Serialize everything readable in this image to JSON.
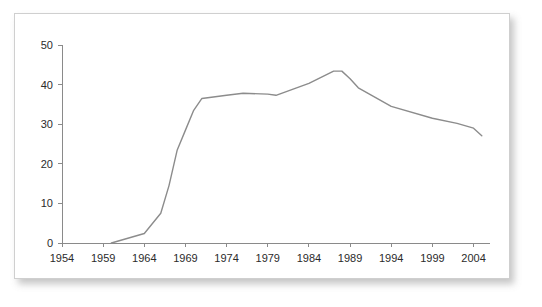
{
  "figure": {
    "background_color": "#ffffff",
    "card_background_color": "#ffffff",
    "card_border_color": "#cfcfcf",
    "line_color": "#8c8c8c",
    "axis_color": "#8a8a8a",
    "text_color": "#2b2b2b"
  },
  "chart_data": {
    "type": "line",
    "title": "",
    "subtitle": "",
    "xlabel": "",
    "ylabel": "",
    "xlim": [
      1954,
      2006
    ],
    "ylim": [
      0,
      50
    ],
    "grid": false,
    "legend": null,
    "legend_position": "none",
    "x_ticks": [
      1954,
      1959,
      1964,
      1969,
      1974,
      1979,
      1984,
      1989,
      1994,
      1999,
      2004
    ],
    "x_tick_labels": [
      "1954",
      "1959",
      "1964",
      "1969",
      "1974",
      "1979",
      "1984",
      "1989",
      "1994",
      "1999",
      "2004"
    ],
    "y_ticks": [
      0,
      10,
      20,
      30,
      40,
      50
    ],
    "y_tick_labels": [
      "0",
      "10",
      "20",
      "30",
      "40",
      "50"
    ],
    "series": [
      {
        "name": "series-1",
        "color": "#8c8c8c",
        "x": [
          1960,
          1964,
          1966,
          1967,
          1968,
          1969,
          1970,
          1971,
          1974,
          1976,
          1979,
          1980,
          1984,
          1987,
          1988,
          1989,
          1990,
          1994,
          1999,
          2002,
          2004,
          2005
        ],
        "values": [
          0.0,
          2.4,
          7.5,
          14.5,
          23.5,
          28.5,
          33.5,
          36.5,
          37.3,
          37.8,
          37.6,
          37.3,
          40.3,
          43.4,
          43.4,
          41.5,
          39.2,
          34.5,
          31.5,
          30.2,
          29.0,
          27.1
        ]
      }
    ]
  }
}
